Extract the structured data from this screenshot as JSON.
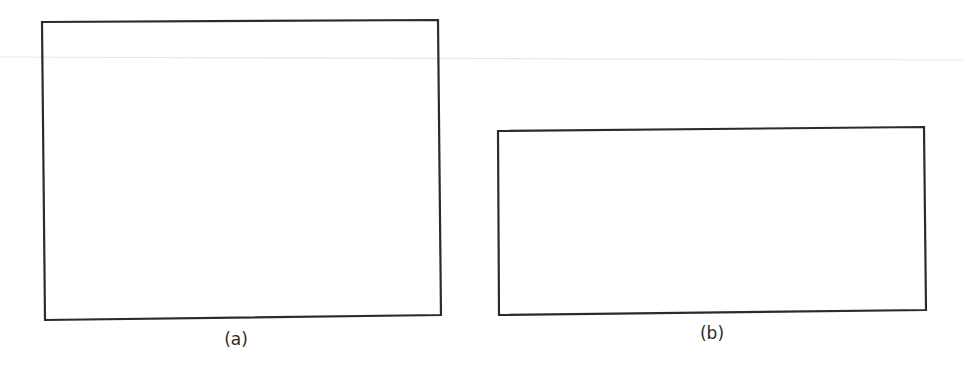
{
  "figure": {
    "panels": [
      {
        "id": "a",
        "caption": "(a)",
        "shape": "rectangle",
        "corners": {
          "tl": [
            42,
            22
          ],
          "tr": [
            438,
            20
          ],
          "br": [
            441,
            315
          ],
          "bl": [
            45,
            320
          ]
        },
        "caption_pos": [
          236,
          341
        ]
      },
      {
        "id": "b",
        "caption": "(b)",
        "shape": "rectangle",
        "corners": {
          "tl": [
            498,
            131
          ],
          "tr": [
            924,
            127
          ],
          "br": [
            926,
            310
          ],
          "bl": [
            499,
            315
          ]
        },
        "caption_pos": [
          712,
          335
        ]
      }
    ],
    "stroke_color": "#2b2b2b",
    "artifact_line_color": "#e6e6e6"
  }
}
